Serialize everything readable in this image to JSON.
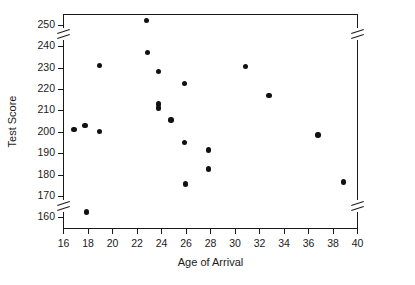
{
  "chart_data": {
    "type": "scatter",
    "title": "",
    "xlabel": "Age of Arrival",
    "ylabel": "Test Score",
    "xlim": [
      16,
      40
    ],
    "ylim": [
      155,
      255
    ],
    "xticks": [
      16,
      18,
      20,
      22,
      24,
      26,
      28,
      30,
      32,
      34,
      36,
      38,
      40
    ],
    "yticks": [
      160,
      170,
      180,
      190,
      200,
      210,
      220,
      230,
      240,
      250
    ],
    "grid": false,
    "legend": null,
    "axis_breaks": {
      "y_top": true,
      "y_bottom": true,
      "note": "vertical axes are broken above 250 and below 160"
    },
    "marker": {
      "shape": "circle",
      "filled": true,
      "color": "#111111",
      "size_px": 5.4
    },
    "points": [
      {
        "x": 16.9,
        "y": 201
      },
      {
        "x": 17.8,
        "y": 203
      },
      {
        "x": 17.9,
        "y": 162.5
      },
      {
        "x": 19.0,
        "y": 200
      },
      {
        "x": 19.0,
        "y": 231
      },
      {
        "x": 22.8,
        "y": 252
      },
      {
        "x": 22.9,
        "y": 237
      },
      {
        "x": 23.8,
        "y": 228
      },
      {
        "x": 23.8,
        "y": 213
      },
      {
        "x": 23.8,
        "y": 211
      },
      {
        "x": 24.8,
        "y": 205.5
      },
      {
        "x": 25.9,
        "y": 222.5
      },
      {
        "x": 25.9,
        "y": 195
      },
      {
        "x": 26.0,
        "y": 175.5
      },
      {
        "x": 27.9,
        "y": 191.5
      },
      {
        "x": 27.9,
        "y": 182.5
      },
      {
        "x": 30.9,
        "y": 230.5
      },
      {
        "x": 32.8,
        "y": 217
      },
      {
        "x": 36.8,
        "y": 198.5
      },
      {
        "x": 38.9,
        "y": 176.5
      }
    ]
  },
  "colors": {
    "axis": "#1a1a1a",
    "marker": "#111111",
    "background": "#ffffff"
  }
}
